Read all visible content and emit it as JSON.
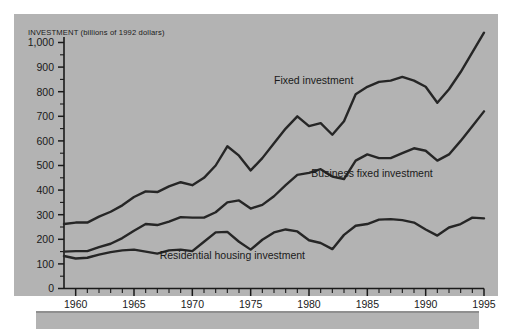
{
  "figure": {
    "background_color": "#b3b3b3",
    "line_color": "#262626",
    "axis_color": "#1a1a1a"
  },
  "chart_data": {
    "type": "line",
    "title": "",
    "axis_header": "INVESTMENT (billions of 1992 dollars)",
    "xlabel": "",
    "ylabel": "INVESTMENT (billions of 1992 dollars)",
    "xlim": [
      1959,
      1995
    ],
    "ylim": [
      0,
      1050
    ],
    "ytick_labels": [
      "0",
      "100",
      "200",
      "300",
      "400",
      "500",
      "600",
      "700",
      "800",
      "900",
      "1,000"
    ],
    "ytick_values": [
      0,
      100,
      200,
      300,
      400,
      500,
      600,
      700,
      800,
      900,
      1000
    ],
    "xtick_labels": [
      "1960",
      "1965",
      "1970",
      "1975",
      "1980",
      "1985",
      "1990",
      "1995"
    ],
    "xtick_values": [
      1960,
      1965,
      1970,
      1975,
      1980,
      1985,
      1990,
      1995
    ],
    "grid": false,
    "legend_position": "inline-annotations",
    "x": [
      1959,
      1960,
      1961,
      1962,
      1963,
      1964,
      1965,
      1966,
      1967,
      1968,
      1969,
      1970,
      1971,
      1972,
      1973,
      1974,
      1975,
      1976,
      1977,
      1978,
      1979,
      1980,
      1981,
      1982,
      1983,
      1984,
      1985,
      1986,
      1987,
      1988,
      1989,
      1990,
      1991,
      1992,
      1993,
      1994,
      1995
    ],
    "series": [
      {
        "name": "Fixed investment",
        "label": "Fixed investment",
        "label_x": 1977.0,
        "label_y": 830,
        "values": [
          262,
          268,
          268,
          292,
          312,
          338,
          372,
          395,
          392,
          415,
          432,
          420,
          450,
          500,
          578,
          540,
          480,
          530,
          590,
          650,
          700,
          660,
          672,
          625,
          680,
          790,
          820,
          840,
          845,
          860,
          845,
          820,
          755,
          810,
          880,
          960,
          1040
        ]
      },
      {
        "name": "Business fixed investment",
        "label": "Business fixed investment",
        "label_x": 1980.2,
        "label_y": 455,
        "values": [
          150,
          152,
          152,
          168,
          182,
          205,
          235,
          262,
          258,
          272,
          290,
          288,
          288,
          310,
          350,
          358,
          325,
          340,
          375,
          420,
          462,
          470,
          485,
          455,
          445,
          520,
          545,
          530,
          530,
          550,
          570,
          560,
          520,
          545,
          600,
          660,
          720
        ]
      },
      {
        "name": "Residential housing investment",
        "label": "Residential housing investment",
        "label_x": 1967.2,
        "label_y": 120,
        "values": [
          132,
          122,
          125,
          138,
          148,
          155,
          158,
          150,
          142,
          155,
          158,
          152,
          190,
          228,
          230,
          190,
          158,
          198,
          228,
          240,
          232,
          196,
          185,
          160,
          218,
          255,
          262,
          280,
          282,
          278,
          268,
          240,
          215,
          248,
          262,
          288,
          285
        ]
      }
    ]
  }
}
